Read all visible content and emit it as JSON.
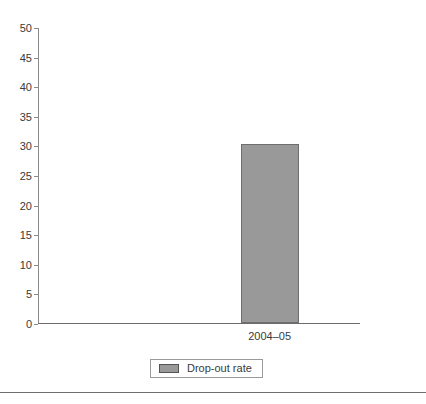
{
  "chart_data": {
    "type": "bar",
    "title": "",
    "subtitle": "",
    "xlabel": "",
    "ylabel": "",
    "categories": [
      "2004–05"
    ],
    "series": [
      {
        "name": "Drop-out rate",
        "values": [
          30.2
        ],
        "color": "#999999"
      }
    ],
    "ylim": [
      0,
      50
    ],
    "yticks": [
      0,
      5,
      10,
      15,
      20,
      25,
      30,
      35,
      40,
      45,
      50
    ],
    "ytick_labels": [
      "0",
      "5",
      "10",
      "15",
      "20",
      "25",
      "30",
      "35",
      "40",
      "45",
      "50"
    ],
    "grid": false,
    "legend": {
      "position": "bottom-center",
      "entries": [
        {
          "label": "Drop-out rate",
          "swatch_color": "#999999",
          "swatch_border": "#555555"
        }
      ]
    },
    "axis_color": "#8a8a8a",
    "text_color": "#3a3a3a",
    "background": "#ffffff",
    "bar_border_color": "#6e6e6e"
  },
  "footer": {
    "rule_color": "#6f6f6f"
  }
}
